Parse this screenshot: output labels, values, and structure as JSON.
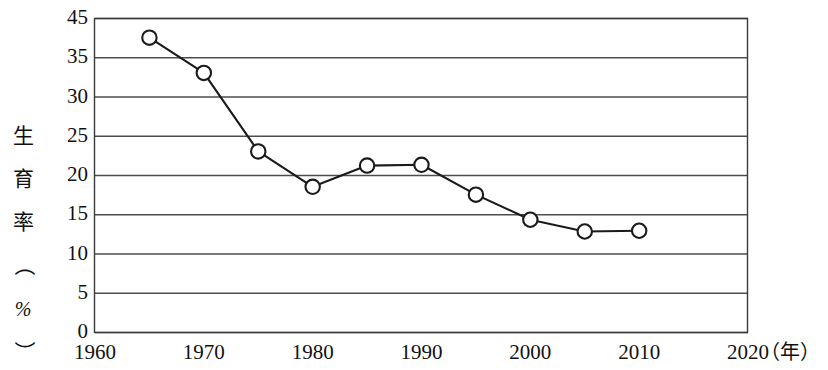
{
  "chart_data": {
    "type": "line",
    "title": "",
    "xlabel": "年",
    "ylabel": "生育率（%）",
    "x": [
      1965,
      1970,
      1975,
      1980,
      1985,
      1990,
      1995,
      2000,
      2005,
      2010
    ],
    "values": [
      40.0,
      33.0,
      23.0,
      18.5,
      21.2,
      21.3,
      17.5,
      14.3,
      12.8,
      12.9
    ],
    "series": [
      {
        "name": "生育率",
        "values": [
          40.0,
          33.0,
          23.0,
          18.5,
          21.2,
          21.3,
          17.5,
          14.3,
          12.8,
          12.9
        ]
      }
    ],
    "xlim": [
      1960,
      2020
    ],
    "ylim": [
      0,
      45
    ],
    "x_tick_labels": [
      "1960",
      "1970",
      "1980",
      "1990",
      "2000",
      "2010",
      "2020"
    ],
    "x_tick_values": [
      1960,
      1970,
      1980,
      1990,
      2000,
      2010,
      2020
    ],
    "y_tick_labels": [
      "45",
      "35",
      "30",
      "25",
      "20",
      "15",
      "10",
      "5",
      "0"
    ],
    "y_gridline_count": 9,
    "grid": true,
    "legend": "none",
    "marker": "open-circle",
    "line_color": "#1a1a1a",
    "marker_fill": "#ffffff",
    "grid_color": "#4d4d4d",
    "background": "#ffffff"
  },
  "axes": {
    "y_title_chars": [
      "生",
      "育",
      "率"
    ],
    "y_title_paren_open": "（",
    "y_title_percent": "%",
    "y_title_paren_close": "）",
    "x_unit": "（年）"
  }
}
